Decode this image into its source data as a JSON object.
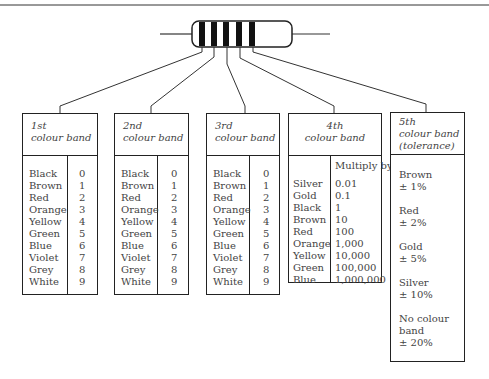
{
  "resistor": {
    "bands": 5,
    "band_color": "#111111"
  },
  "bands": [
    {
      "title_line1": "1st",
      "title_line2": "colour band",
      "colours": [
        "Black",
        "Brown",
        "Red",
        "Orange",
        "Yellow",
        "Green",
        "Blue",
        "Violet",
        "Grey",
        "White"
      ],
      "values": [
        "0",
        "1",
        "2",
        "3",
        "4",
        "5",
        "6",
        "7",
        "8",
        "9"
      ]
    },
    {
      "title_line1": "2nd",
      "title_line2": "colour band",
      "colours": [
        "Black",
        "Brown",
        "Red",
        "Orange",
        "Yellow",
        "Green",
        "Blue",
        "Violet",
        "Grey",
        "White"
      ],
      "values": [
        "0",
        "1",
        "2",
        "3",
        "4",
        "5",
        "6",
        "7",
        "8",
        "9"
      ]
    },
    {
      "title_line1": "3rd",
      "title_line2": "colour band",
      "colours": [
        "Black",
        "Brown",
        "Red",
        "Orange",
        "Yellow",
        "Green",
        "Blue",
        "Violet",
        "Grey",
        "White"
      ],
      "values": [
        "0",
        "1",
        "2",
        "3",
        "4",
        "5",
        "6",
        "7",
        "8",
        "9"
      ]
    },
    {
      "title_line1": "4th",
      "title_line2": "colour band",
      "column_header": "Multiply by",
      "colours": [
        "Silver",
        "Gold",
        "Black",
        "Brown",
        "Red",
        "Orange",
        "Yellow",
        "Green",
        "Blue"
      ],
      "values": [
        "0.01",
        "0.1",
        "1",
        "10",
        "100",
        "1,000",
        "10,000",
        "100,000",
        "1,000,000"
      ]
    },
    {
      "title_line1": "5th",
      "title_line2": "colour band",
      "title_line3": "(tolerance)",
      "tolerances": [
        {
          "colour": "Brown",
          "value": "± 1%"
        },
        {
          "colour": "Red",
          "value": "± 2%"
        },
        {
          "colour": "Gold",
          "value": "± 5%"
        },
        {
          "colour": "Silver",
          "value": "± 10%"
        },
        {
          "colour": "No colour band",
          "value": "± 20%"
        }
      ]
    }
  ]
}
